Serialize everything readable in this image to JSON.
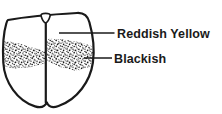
{
  "figure": {
    "labels": [
      {
        "id": "reddish-yellow",
        "text": "Reddish Yellow"
      },
      {
        "id": "blackish",
        "text": "Blackish"
      }
    ],
    "colors": {
      "ink": "#1a1a1a",
      "background": "#ffffff"
    }
  }
}
